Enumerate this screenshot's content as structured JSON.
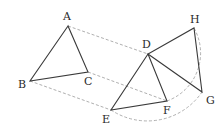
{
  "diagram": {
    "type": "geometry-translation-rotation",
    "points": {
      "A": {
        "x": 68,
        "y": 26,
        "label": "A",
        "lx": 63,
        "ly": 20
      },
      "B": {
        "x": 30,
        "y": 81,
        "label": "B",
        "lx": 18,
        "ly": 88
      },
      "C": {
        "x": 88,
        "y": 72,
        "label": "C",
        "lx": 84,
        "ly": 85
      },
      "D": {
        "x": 148,
        "y": 54,
        "label": "D",
        "lx": 142,
        "ly": 48
      },
      "E": {
        "x": 111,
        "y": 110,
        "label": "E",
        "lx": 102,
        "ly": 123
      },
      "F": {
        "x": 167,
        "y": 101,
        "label": "F",
        "lx": 163,
        "ly": 114
      },
      "G": {
        "x": 202,
        "y": 92,
        "label": "G",
        "lx": 206,
        "ly": 104
      },
      "H": {
        "x": 194,
        "y": 28,
        "label": "H",
        "lx": 190,
        "ly": 23
      }
    },
    "labels": {
      "A": "A",
      "B": "B",
      "C": "C",
      "D": "D",
      "E": "E",
      "F": "F",
      "G": "G",
      "H": "H"
    },
    "solid_segments": [
      [
        "A",
        "B"
      ],
      [
        "B",
        "C"
      ],
      [
        "C",
        "A"
      ],
      [
        "D",
        "E"
      ],
      [
        "E",
        "F"
      ],
      [
        "F",
        "D"
      ],
      [
        "D",
        "G"
      ],
      [
        "D",
        "H"
      ],
      [
        "H",
        "G"
      ]
    ],
    "dashed_segments": [
      [
        "A",
        "D"
      ],
      [
        "B",
        "E"
      ],
      [
        "C",
        "F"
      ]
    ],
    "dashed_arcs": [
      {
        "center": "D",
        "from": "E",
        "to": "G"
      },
      {
        "center": "D",
        "from": "F",
        "to": "H"
      }
    ],
    "colors": {
      "solid": "#3a3a3a",
      "dashed": "#9a9a9a",
      "text": "#2a2a2a"
    }
  }
}
